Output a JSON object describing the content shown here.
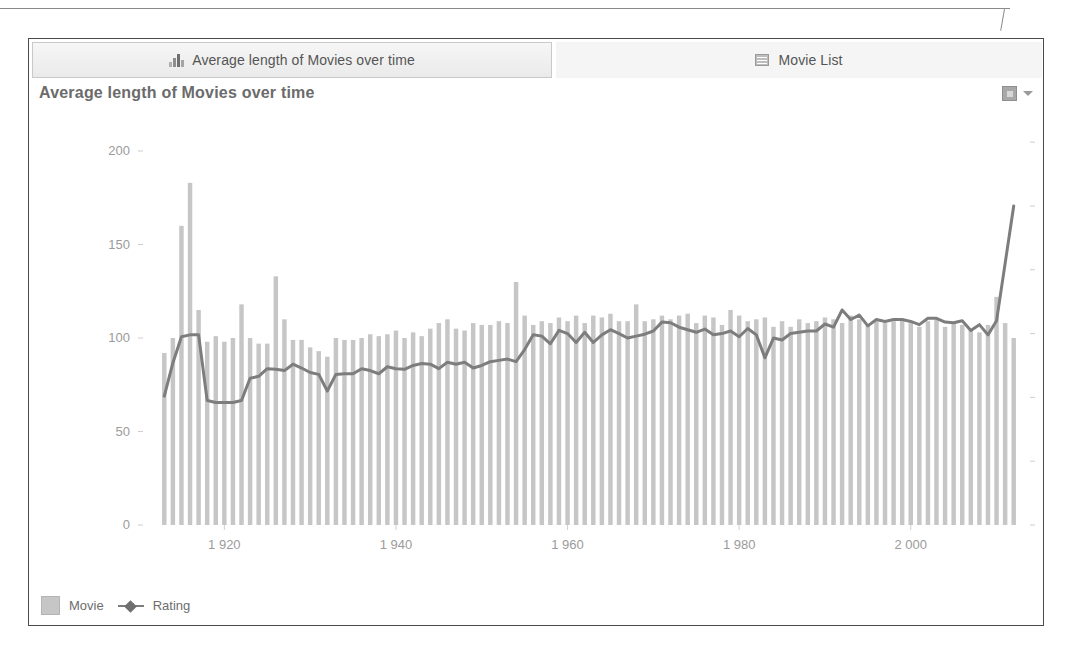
{
  "panel": {
    "tabs": [
      {
        "label": "Average length of Movies over time",
        "icon": "bar-chart-icon",
        "active": true
      },
      {
        "label": "Movie List",
        "icon": "list-icon",
        "active": false
      }
    ],
    "options_menu": {
      "icon": "chart-options-icon",
      "caret": "chevron-down-icon"
    }
  },
  "colors": {
    "bar": "#c6c6c6",
    "line": "#7d7d7d",
    "axis_text": "#9b9b9b",
    "title_text": "#6b6b6b",
    "tab_text": "#555555",
    "panel_border": "#4a4a4a",
    "background": "#ffffff"
  },
  "chart_data": {
    "type": "bar",
    "title": "Average length of Movies over time",
    "xlabel": "",
    "ylabel": "",
    "grid": false,
    "legend_position": "bottom-left",
    "x": [
      1913,
      1914,
      1915,
      1916,
      1917,
      1918,
      1919,
      1920,
      1921,
      1922,
      1923,
      1924,
      1925,
      1926,
      1927,
      1928,
      1929,
      1930,
      1931,
      1932,
      1933,
      1934,
      1935,
      1936,
      1937,
      1938,
      1939,
      1940,
      1941,
      1942,
      1943,
      1944,
      1945,
      1946,
      1947,
      1948,
      1949,
      1950,
      1951,
      1952,
      1953,
      1954,
      1955,
      1956,
      1957,
      1958,
      1959,
      1960,
      1961,
      1962,
      1963,
      1964,
      1965,
      1966,
      1967,
      1968,
      1969,
      1970,
      1971,
      1972,
      1973,
      1974,
      1975,
      1976,
      1977,
      1978,
      1979,
      1980,
      1981,
      1982,
      1983,
      1984,
      1985,
      1986,
      1987,
      1988,
      1989,
      1990,
      1991,
      1992,
      1993,
      1994,
      1995,
      1996,
      1997,
      1998,
      1999,
      2000,
      2001,
      2002,
      2003,
      2004,
      2005,
      2006,
      2007,
      2008,
      2009,
      2010,
      2011,
      2012
    ],
    "x_tick_labels": [
      "1 920",
      "1 940",
      "1 960",
      "1 980",
      "2 000"
    ],
    "x_tick_values": [
      1920,
      1940,
      1960,
      1980,
      2000
    ],
    "axes": {
      "left": {
        "name": "Movie",
        "ticks": [
          0,
          50,
          100,
          150,
          200
        ],
        "tick_labels": [
          "0",
          "50",
          "100",
          "150",
          "200"
        ],
        "min": 0,
        "max": 215
      },
      "right": {
        "name": "Rating",
        "ticks": [
          0,
          1,
          2,
          3,
          4,
          5,
          6
        ],
        "tick_labels": [
          "0",
          "1",
          "2",
          "3",
          "4",
          "5",
          "6"
        ],
        "min": 0,
        "max": 6.3
      }
    },
    "series": [
      {
        "name": "Movie",
        "type": "bar",
        "axis": "left",
        "color": "#c6c6c6",
        "values": [
          92,
          100,
          160,
          183,
          115,
          98,
          101,
          98,
          100,
          118,
          100,
          97,
          97,
          133,
          110,
          99,
          99,
          95,
          93,
          90,
          100,
          99,
          99,
          100,
          102,
          101,
          102,
          104,
          100,
          103,
          101,
          105,
          108,
          110,
          105,
          104,
          108,
          107,
          107,
          109,
          108,
          130,
          112,
          107,
          109,
          108,
          111,
          109,
          112,
          108,
          112,
          111,
          113,
          109,
          109,
          118,
          109,
          110,
          112,
          110,
          112,
          113,
          108,
          112,
          111,
          107,
          115,
          112,
          109,
          110,
          111,
          106,
          109,
          106,
          110,
          108,
          109,
          111,
          110,
          108,
          112,
          110,
          107,
          109,
          108,
          109,
          110,
          108,
          106,
          109,
          110,
          106,
          108,
          107,
          105,
          103,
          107,
          122,
          108,
          100
        ]
      },
      {
        "name": "Rating",
        "type": "line",
        "axis": "right",
        "color": "#7d7d7d",
        "values": [
          2.02,
          2.54,
          2.95,
          2.98,
          2.98,
          1.95,
          1.92,
          1.92,
          1.92,
          1.95,
          2.3,
          2.33,
          2.45,
          2.44,
          2.42,
          2.52,
          2.46,
          2.39,
          2.36,
          2.1,
          2.36,
          2.37,
          2.37,
          2.45,
          2.42,
          2.37,
          2.48,
          2.45,
          2.44,
          2.5,
          2.53,
          2.52,
          2.45,
          2.55,
          2.52,
          2.55,
          2.46,
          2.5,
          2.56,
          2.58,
          2.6,
          2.56,
          2.75,
          2.98,
          2.96,
          2.84,
          3.05,
          3.0,
          2.86,
          3.02,
          2.86,
          2.98,
          3.06,
          3.0,
          2.93,
          2.96,
          2.99,
          3.04,
          3.18,
          3.17,
          3.1,
          3.06,
          3.02,
          3.07,
          2.98,
          3.0,
          3.04,
          2.95,
          3.08,
          2.98,
          2.62,
          2.93,
          2.9,
          3.0,
          3.02,
          3.04,
          3.04,
          3.15,
          3.1,
          3.37,
          3.22,
          3.29,
          3.12,
          3.22,
          3.19,
          3.22,
          3.22,
          3.19,
          3.14,
          3.24,
          3.24,
          3.18,
          3.17,
          3.2,
          3.05,
          3.14,
          2.98,
          3.2,
          4.1,
          5.0
        ]
      }
    ]
  }
}
